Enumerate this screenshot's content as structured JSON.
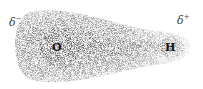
{
  "diagram": {
    "atoms": [
      {
        "symbol": "O",
        "x": 57,
        "y": 48
      },
      {
        "symbol": "H",
        "x": 170,
        "y": 48
      }
    ],
    "charges": [
      {
        "symbol": "δ",
        "sign": "−",
        "x": 10,
        "y": 20
      },
      {
        "symbol": "δ",
        "sign": "+",
        "x": 178,
        "y": 18
      }
    ],
    "cloud_color": "#555555"
  }
}
